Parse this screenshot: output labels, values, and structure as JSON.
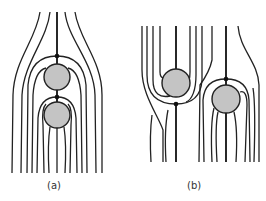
{
  "figure": {
    "panels": [
      {
        "id": "a",
        "label": "(a)",
        "description": "Two spheres aligned vertically (in-line) in a flow; streamlines diverge around them with stagnation points above each sphere"
      },
      {
        "id": "b",
        "label": "(b)",
        "description": "Two spheres side by side, vertically offset; streamlines pass around each with stagnation points on opposite sides"
      }
    ],
    "colors": {
      "sphere_fill": "#c4c4c4",
      "line": "#222222",
      "background": "#ffffff"
    }
  }
}
